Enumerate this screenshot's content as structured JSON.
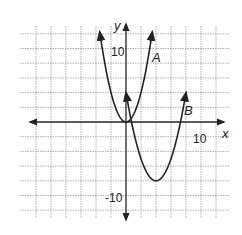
{
  "chart_data": {
    "type": "line",
    "title": "",
    "xlabel": "x",
    "ylabel": "y",
    "xlim": [
      -12,
      12
    ],
    "ylim": [
      -12,
      12
    ],
    "grid": true,
    "grid_step": 2,
    "tick_labels": {
      "x": [
        {
          "value": 10,
          "label": "10"
        }
      ],
      "y": [
        {
          "value": 10,
          "label": "10"
        },
        {
          "value": -10,
          "label": "-10"
        }
      ]
    },
    "series": [
      {
        "name": "A",
        "equation": "y = x^2",
        "vertex": [
          0,
          0
        ],
        "x": [
          -3.5,
          -3,
          -2,
          -1,
          0,
          1,
          2,
          3,
          3.5
        ],
        "y": [
          12.25,
          9,
          4,
          1,
          0,
          1,
          4,
          9,
          12.25
        ]
      },
      {
        "name": "B",
        "equation": "y = 0.75(x - 4)^2 - 8",
        "vertex": [
          4,
          -8
        ],
        "x": [
          0,
          1,
          2,
          3,
          4,
          5,
          6,
          7,
          8
        ],
        "y": [
          4,
          -1.25,
          -5,
          -7.25,
          -8,
          -7.25,
          -5,
          -1.25,
          4
        ]
      }
    ],
    "annotations": [
      {
        "text": "A",
        "x": 3.8,
        "y": 9.5
      },
      {
        "text": "B",
        "x": 8.3,
        "y": 1.6
      }
    ]
  },
  "labels": {
    "x_axis": "x",
    "y_axis": "y",
    "x_tick_10": "10",
    "y_tick_10": "10",
    "y_tick_neg10": "-10",
    "curve_a": "A",
    "curve_b": "B"
  }
}
